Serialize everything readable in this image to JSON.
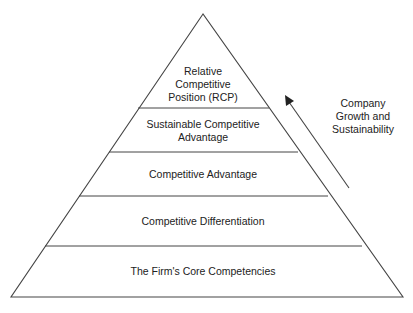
{
  "diagram": {
    "type": "pyramid",
    "levels": [
      {
        "label_lines": [
          "Relative",
          "Competitive",
          "Position (RCP)"
        ]
      },
      {
        "label_lines": [
          "Sustainable Competitive",
          "Advantage"
        ]
      },
      {
        "label_lines": [
          "Competitive Advantage"
        ]
      },
      {
        "label_lines": [
          "Competitive Differentiation"
        ]
      },
      {
        "label_lines": [
          "The Firm's Core Competencies"
        ]
      }
    ],
    "arrow": {
      "direction": "up",
      "label_lines": [
        "Company",
        "Growth and",
        "Sustainability"
      ]
    },
    "colors": {
      "line": "#444444",
      "background": "#ffffff",
      "text": "#222222"
    }
  }
}
